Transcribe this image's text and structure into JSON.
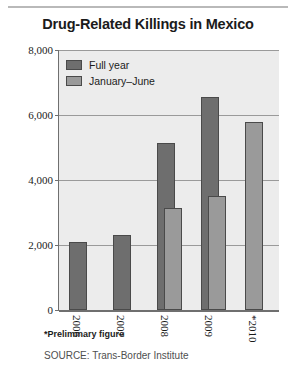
{
  "chart_data": {
    "type": "bar",
    "title": "Drug-Related Killings in Mexico",
    "xlabel": "",
    "ylabel": "",
    "categories": [
      "2006",
      "2007",
      "2008",
      "2009",
      "*2010"
    ],
    "series": [
      {
        "name": "Full year",
        "values": [
          2100,
          2300,
          5150,
          6550,
          null
        ]
      },
      {
        "name": "January–June",
        "values": [
          null,
          null,
          3150,
          3500,
          5800
        ]
      }
    ],
    "ylim": [
      0,
      8000
    ],
    "yticks": [
      0,
      2000,
      4000,
      6000,
      8000
    ],
    "ytick_labels": [
      "0",
      "2,000",
      "4,000",
      "6,000",
      "8,000"
    ],
    "grid": true,
    "legend_position": "top-left",
    "colors": {
      "full_year": "#6e6e6e",
      "january_june": "#9a9a9a",
      "plot_background": "#ececec",
      "gridline": "#9a9a9a",
      "axis": "#6f6f6f",
      "text": "#1b1b1b"
    },
    "annotations": {
      "footnote": "*Preliminary figure",
      "source": "SOURCE: Trans-Border Institute"
    }
  },
  "legend": {
    "items": [
      {
        "label": "Full year"
      },
      {
        "label": "January–June"
      }
    ]
  },
  "notes": {
    "footnote": "*Preliminary figure",
    "source": "SOURCE: Trans-Border Institute"
  }
}
